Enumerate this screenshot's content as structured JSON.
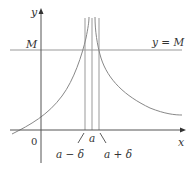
{
  "figure": {
    "type": "function-graph"
  },
  "labels": {
    "y_axis": "y",
    "x_axis": "x",
    "origin": "0",
    "M_tick": "M",
    "line_label": "y = M",
    "a": "a",
    "a_minus_delta": "a − δ",
    "a_plus_delta": "a + δ"
  },
  "colors": {
    "axes": "#333333",
    "curve": "#8a8a8a",
    "lines": "#9a9a9a",
    "text": "#333333"
  }
}
